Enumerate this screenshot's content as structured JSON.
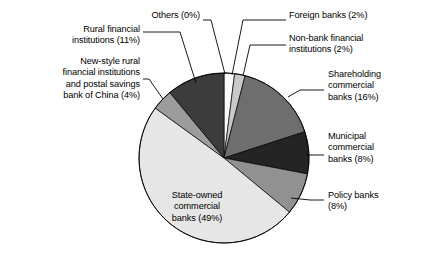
{
  "chart_data": {
    "type": "pie",
    "title": "",
    "subtitle": "",
    "xlabel": "",
    "ylabel": "",
    "legend_position": "none",
    "grid": false,
    "labels_inline": true,
    "units": "percent",
    "categories": [
      "Others",
      "Foreign banks",
      "Non-bank financial institutions",
      "Shareholding commercial banks",
      "Municipal commercial banks",
      "Policy banks",
      "State-owned commercial banks",
      "New-style rural financial institutions and postal savings bank of China",
      "Rural financial institutions"
    ],
    "values": [
      0,
      2,
      2,
      16,
      8,
      8,
      49,
      4,
      11
    ],
    "colors": [
      "#000000",
      "#fbfbfb",
      "#c9c9c9",
      "#6e6e6e",
      "#242424",
      "#919191",
      "#e6e6e6",
      "#9c9c9c",
      "#3c3c3c"
    ],
    "slices": [
      {
        "name": "Others",
        "value": 0,
        "value_text": "0%",
        "label_text": "Others (0%)",
        "color": "#000000"
      },
      {
        "name": "Foreign banks",
        "value": 2,
        "value_text": "2%",
        "label_text": "Foreign banks (2%)",
        "color": "#fbfbfb"
      },
      {
        "name": "Non-bank financial institutions",
        "value": 2,
        "value_text": "2%",
        "label_text": "Non-bank financial institutions (2%)",
        "color": "#c9c9c9"
      },
      {
        "name": "Shareholding commercial banks",
        "value": 16,
        "value_text": "16%",
        "label_text": "Shareholding commercial banks (16%)",
        "color": "#6e6e6e"
      },
      {
        "name": "Municipal commercial banks",
        "value": 8,
        "value_text": "8%",
        "label_text": "Municipal commercial banks (8%)",
        "color": "#242424"
      },
      {
        "name": "Policy banks",
        "value": 8,
        "value_text": "8%",
        "label_text": "Policy banks (8%)",
        "color": "#919191"
      },
      {
        "name": "State-owned commercial banks",
        "value": 49,
        "value_text": "49%",
        "label_text": "State-owned commercial banks (49%)",
        "color": "#e6e6e6"
      },
      {
        "name": "New-style rural financial institutions and postal savings bank of China",
        "value": 4,
        "value_text": "4%",
        "label_text": "New-style rural financial institutions and postal savings bank of China (4%)",
        "color": "#9c9c9c"
      },
      {
        "name": "Rural financial institutions",
        "value": 11,
        "value_text": "11%",
        "label_text": "Rural financial institutions (11%)",
        "color": "#3c3c3c"
      }
    ]
  },
  "labels": {
    "others": "Others (0%)",
    "rural_financial_institutions": "Rural financial\ninstitutions (11%)",
    "new_style_rural": "New-style rural\nfinancial institutions\nand postal savings\nbank of China (4%)",
    "foreign_banks": "Foreign banks (2%)",
    "non_bank_financial": "Non-bank financial\ninstitutions (2%)",
    "shareholding": "Shareholding\ncommercial\nbanks (16%)",
    "municipal": "Municipal\ncommercial\nbanks (8%)",
    "policy_banks": "Policy banks\n(8%)",
    "state_owned": "State-owned\ncommercial\nbanks (49%)"
  },
  "style": {
    "background": "#ffffff",
    "outline": "#000000",
    "leader_line": "#000000"
  }
}
